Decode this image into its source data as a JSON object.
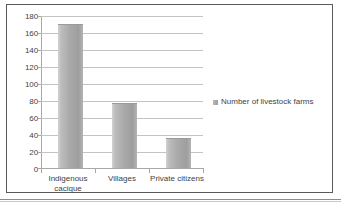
{
  "chart_data": {
    "type": "bar",
    "title": "",
    "xlabel": "",
    "ylabel": "",
    "categories": [
      "Indigenous cacique",
      "Villages",
      "Private citizens"
    ],
    "series": [
      {
        "name": "Number of livestock farms",
        "values": [
          170,
          77,
          36
        ]
      }
    ],
    "ylim": [
      0,
      180
    ],
    "ytick_labels": [
      "180",
      "160",
      "140",
      "120",
      "100",
      "80",
      "60",
      "40",
      "20",
      "0"
    ],
    "ytick_values": [
      180,
      160,
      140,
      120,
      100,
      80,
      60,
      40,
      20,
      0
    ],
    "grid": true,
    "legend_position": "right",
    "bar_color": "#a9a9a9",
    "gridline_color": "#c3c3c3",
    "axis_color": "#a8a8a8",
    "text_color": "#3f3f3f",
    "border_color": "#5a5a5a"
  },
  "legend": {
    "entries": [
      {
        "label": "Number of livestock farms",
        "marker": "square-marker"
      }
    ]
  },
  "category_labels": {
    "cat0_line1": "Indigenous",
    "cat0_line2": "cacique",
    "cat1_line1": "Villages",
    "cat2_line1": "Private citizens"
  }
}
